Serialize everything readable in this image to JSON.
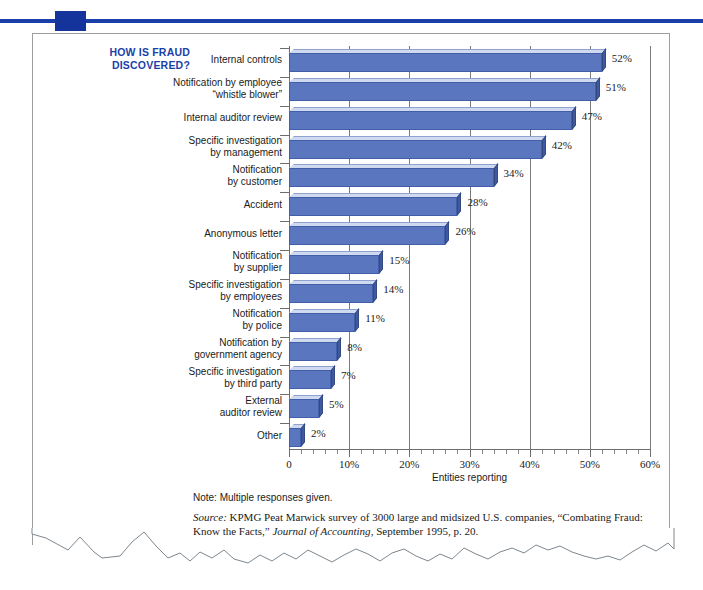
{
  "decoration": {
    "rule_color": "#1b3fa8",
    "square_color": "#15349b",
    "border_color": "#9d9d9d"
  },
  "chart_title": "HOW IS FRAUD\nDISCOVERED?",
  "title_color": "#1b3fa8",
  "note": "Note: Multiple responses given.",
  "source": {
    "label": "Source:",
    "text_1": " KPMG Peat Marwick survey of 3000 large and midsized U.S. companies, “Combating Fraud: Know the Facts,” ",
    "journal": "Journal of Accounting",
    "text_2": ", September 1995, p. 20."
  },
  "chart_data": {
    "type": "bar",
    "orientation": "horizontal",
    "title": "HOW IS FRAUD DISCOVERED?",
    "xlabel": "Entities reporting",
    "ylabel": "",
    "xlim": [
      0,
      60
    ],
    "xtick_labels": [
      "0",
      "10%",
      "20%",
      "30%",
      "40%",
      "50%",
      "60%"
    ],
    "xtick_values": [
      0,
      10,
      20,
      30,
      40,
      50,
      60
    ],
    "minor_tick_step": 2,
    "grid": "vertical",
    "legend": "none",
    "bar_color": "#5a76bf",
    "categories": [
      "Internal controls",
      "Notification by employee\n“whistle blower”",
      "Internal auditor review",
      "Specific investigation\nby management",
      "Notification\nby customer",
      "Accident",
      "Anonymous letter",
      "Notification\nby supplier",
      "Specific investigation\nby employees",
      "Notification\nby police",
      "Notification by\ngovernment agency",
      "Specific investigation\nby third party",
      "External\nauditor review",
      "Other"
    ],
    "values": [
      52,
      51,
      47,
      42,
      34,
      28,
      26,
      15,
      14,
      11,
      8,
      7,
      5,
      2
    ],
    "value_labels": [
      "52%",
      "51%",
      "47%",
      "42%",
      "34%",
      "28%",
      "26%",
      "15%",
      "14%",
      "11%",
      "8%",
      "7%",
      "5%",
      "2%"
    ]
  }
}
